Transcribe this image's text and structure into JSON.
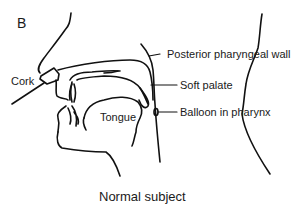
{
  "figure": {
    "panel_letter": "B",
    "caption": "Normal subject",
    "labels": {
      "cork": "Cork",
      "posterior_pharyngeal_wall": "Posterior pharyngeal wall",
      "soft_palate": "Soft palate",
      "balloon_in_pharynx": "Balloon in pharynx",
      "tongue": "Tongue"
    },
    "stroke_color": "#111111",
    "background_color": "#ffffff"
  }
}
